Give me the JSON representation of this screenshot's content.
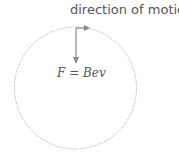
{
  "diagram": {
    "direction_label": "direction of motion",
    "force_label": "F = Bev",
    "colors": {
      "circle": "#999999",
      "arrow": "#888888",
      "text": "#555555"
    },
    "circle": {
      "cx": 75.5,
      "cy": 88,
      "r": 61
    }
  }
}
